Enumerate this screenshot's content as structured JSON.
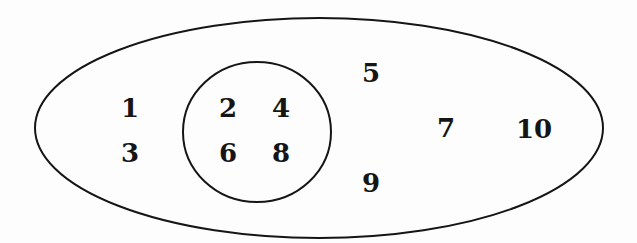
{
  "diagram": {
    "type": "venn",
    "colors": {
      "stroke": "#151515",
      "background": "#fdfdfd",
      "text": "#151515"
    },
    "outer_set": {
      "shape": "ellipse",
      "elements_outside_inner": [
        "1",
        "3",
        "5",
        "7",
        "9",
        "10"
      ]
    },
    "inner_set": {
      "shape": "circle",
      "elements": [
        "2",
        "4",
        "6",
        "8"
      ]
    },
    "numbers": [
      {
        "label": "1",
        "x": 130,
        "y": 108
      },
      {
        "label": "3",
        "x": 130,
        "y": 153
      },
      {
        "label": "2",
        "x": 228,
        "y": 108
      },
      {
        "label": "4",
        "x": 281,
        "y": 108
      },
      {
        "label": "6",
        "x": 228,
        "y": 153
      },
      {
        "label": "8",
        "x": 281,
        "y": 153
      },
      {
        "label": "5",
        "x": 371,
        "y": 73
      },
      {
        "label": "9",
        "x": 371,
        "y": 183
      },
      {
        "label": "7",
        "x": 446,
        "y": 128
      },
      {
        "label": "10",
        "x": 534,
        "y": 129
      }
    ]
  }
}
